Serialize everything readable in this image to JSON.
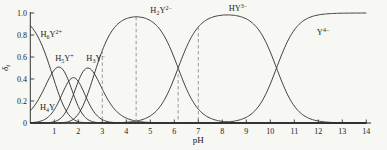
{
  "chart_data": {
    "type": "line",
    "xlabel": "pH",
    "ylabel": {
      "base": "δ",
      "sub": "i"
    },
    "xlim": [
      0,
      14
    ],
    "ylim": [
      0,
      1.0
    ],
    "grid": false,
    "x_ticks": [
      1,
      2,
      3,
      4,
      5,
      6,
      7,
      8,
      9,
      10,
      11,
      12,
      13,
      14
    ],
    "y_ticks": [
      {
        "v": 0,
        "label": "0"
      },
      {
        "v": 0.2,
        "label": "0.2"
      },
      {
        "v": 0.4,
        "label": "0.4"
      },
      {
        "v": 0.6,
        "label": "0.6"
      },
      {
        "v": 0.8,
        "label": "0.8"
      },
      {
        "v": 1.0,
        "label": "1.0"
      }
    ],
    "pka": [
      0.9,
      1.6,
      2.0,
      2.67,
      6.16,
      10.26
    ],
    "series": [
      {
        "id": "h6y",
        "name": "H6Y2+",
        "formula": [
          {
            "t": "H"
          },
          {
            "t": "6",
            "pos": "sub"
          },
          {
            "t": "Y"
          },
          {
            "t": "2+",
            "pos": "sup"
          }
        ],
        "label": {
          "ph": 0.42,
          "delta": 0.78,
          "anchor": "start"
        },
        "peak": {
          "ph": 0,
          "delta": 0.88
        }
      },
      {
        "id": "h5y",
        "name": "H5Y+",
        "formula": [
          {
            "t": "H"
          },
          {
            "t": "5",
            "pos": "sub"
          },
          {
            "t": "Y"
          },
          {
            "t": "+",
            "pos": "sup"
          }
        ],
        "label": {
          "ph": 1.42,
          "delta": 0.565,
          "anchor": "middle"
        },
        "peak": {
          "ph": 1.25,
          "delta": 0.5
        }
      },
      {
        "id": "h4y",
        "name": "H4Y",
        "formula": [
          {
            "t": "H"
          },
          {
            "t": "4",
            "pos": "sub"
          },
          {
            "t": "Y"
          }
        ],
        "label": {
          "ph": 0.72,
          "delta": 0.12,
          "anchor": "middle"
        },
        "peak": {
          "ph": 1.8,
          "delta": 0.41
        }
      },
      {
        "id": "h3y",
        "name": "H3Y-",
        "formula": [
          {
            "t": "H"
          },
          {
            "t": "3",
            "pos": "sub"
          },
          {
            "t": "Y"
          },
          {
            "t": "−",
            "pos": "sup"
          }
        ],
        "label": {
          "ph": 2.72,
          "delta": 0.565,
          "anchor": "middle"
        },
        "peak": {
          "ph": 2.34,
          "delta": 0.48
        }
      },
      {
        "id": "h2y",
        "name": "H2Y2-",
        "formula": [
          {
            "t": "H"
          },
          {
            "t": "2",
            "pos": "sub"
          },
          {
            "t": "Y"
          },
          {
            "t": "2−",
            "pos": "sup"
          }
        ],
        "label": {
          "ph": 5.45,
          "delta": 1.0,
          "anchor": "middle"
        },
        "peak": {
          "ph": 4.4,
          "delta": 0.97
        }
      },
      {
        "id": "hy",
        "name": "HY3-",
        "formula": [
          {
            "t": "H"
          },
          {
            "t": "Y"
          },
          {
            "t": "3−",
            "pos": "sup"
          }
        ],
        "label": {
          "ph": 8.65,
          "delta": 1.02,
          "anchor": "middle"
        },
        "peak": {
          "ph": 8.2,
          "delta": 0.98
        }
      },
      {
        "id": "y4",
        "name": "Y4-",
        "formula": [
          {
            "t": "Y"
          },
          {
            "t": "4−",
            "pos": "sup"
          }
        ],
        "label": {
          "ph": 12.2,
          "delta": 0.8,
          "anchor": "middle"
        },
        "peak": {
          "ph": 14,
          "delta": 1.0
        }
      }
    ],
    "dashed_lines": [
      {
        "ph": 3.0,
        "series": "h2y"
      },
      {
        "ph": 4.41,
        "series": "h2y"
      },
      {
        "ph": 6.16,
        "series": "hy"
      },
      {
        "ph": 7.0,
        "series": "hy"
      }
    ],
    "colors": {
      "curve": "#2b2b2b",
      "axis": "#333333",
      "dashed": "#8f8f8f",
      "text": "#222222",
      "background": "#f7f7f3"
    }
  }
}
